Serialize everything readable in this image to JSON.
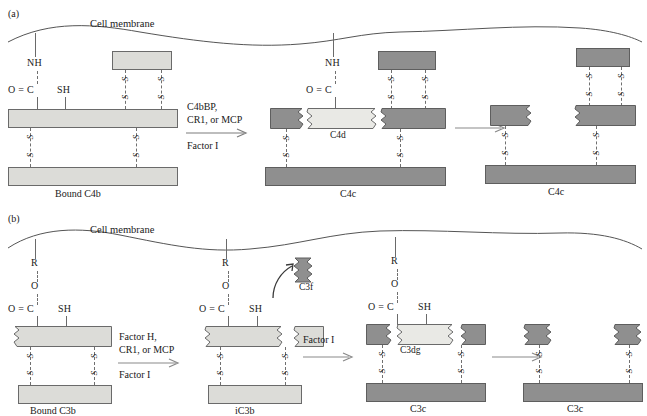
{
  "figure": {
    "type": "diagram",
    "panels": [
      {
        "id": "a",
        "label": "(a)",
        "membrane_label": "Cell membrane",
        "states": [
          {
            "name": "Bound C4b",
            "chem_labels": [
              "NH",
              "O = C",
              "SH"
            ],
            "fragment_labels": []
          },
          {
            "name": "C4c",
            "chem_labels": [
              "NH",
              "O = C"
            ],
            "fragment_labels": [
              "C4d"
            ]
          },
          {
            "name": "C4c",
            "chem_labels": [],
            "fragment_labels": []
          }
        ],
        "reactions": [
          {
            "above": [
              "C4bBP,",
              "CR1, or MCP"
            ],
            "below": [
              "Factor I"
            ]
          },
          {
            "above": [],
            "below": []
          }
        ]
      },
      {
        "id": "b",
        "label": "(b)",
        "membrane_label": "Cell membrane",
        "states": [
          {
            "name": "Bound C3b",
            "chem_labels": [
              "R",
              "O",
              "O = C",
              "SH"
            ],
            "fragment_labels": []
          },
          {
            "name": "iC3b",
            "chem_labels": [
              "R",
              "O",
              "O = C",
              "SH"
            ],
            "fragment_labels": [
              "C3f"
            ]
          },
          {
            "name": "C3c",
            "chem_labels": [
              "R",
              "O",
              "O = C",
              "SH"
            ],
            "fragment_labels": [
              "C3dg"
            ]
          },
          {
            "name": "C3c",
            "chem_labels": [],
            "fragment_labels": []
          }
        ],
        "reactions": [
          {
            "above": [
              "Factor H,",
              "CR1, or MCP"
            ],
            "below": [
              "Factor I"
            ]
          },
          {
            "above": [
              "Factor I"
            ],
            "below": []
          },
          {
            "above": [],
            "below": []
          }
        ]
      }
    ],
    "bond_label": "S",
    "colors": {
      "background": "#ffffff",
      "light_fill": "#dcdcd8",
      "lighter_fill": "#e9e9e5",
      "dark_fill": "#8f8f8f",
      "outline": "#6a6a6a",
      "text": "#1a1a1a",
      "membrane_line": "#555555"
    }
  }
}
